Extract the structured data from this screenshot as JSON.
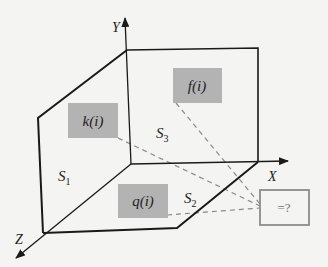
{
  "diagram": {
    "axes": {
      "x_label": "X",
      "y_label": "Y",
      "z_label": "Z"
    },
    "surfaces": {
      "s1": "S",
      "s1_sub": "1",
      "s2": "S",
      "s2_sub": "2",
      "s3": "S",
      "s3_sub": "3"
    },
    "boxes": {
      "k": "k(i)",
      "f": "f(i)",
      "q": "q(i)",
      "result": "=?"
    },
    "colors": {
      "box_fill": "#b3b3b3",
      "line": "#1a1a1a",
      "dashed": "#8a8a8a",
      "result_border": "#8c8c8c",
      "background": "#f4f4f2"
    }
  }
}
